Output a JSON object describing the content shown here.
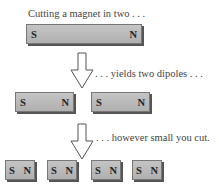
{
  "captions": {
    "step1": "Cutting a magnet in two . . .",
    "step2": ". . . yields two dipoles . . .",
    "step3": ". . . however small you cut."
  },
  "magnets": {
    "whole": {
      "s": "S",
      "n": "N"
    },
    "halves": [
      {
        "s": "S",
        "n": "N"
      },
      {
        "s": "S",
        "n": "N"
      }
    ],
    "quarters": [
      {
        "s": "S",
        "n": "N"
      },
      {
        "s": "S",
        "n": "N"
      },
      {
        "s": "S",
        "n": "N"
      },
      {
        "s": "S",
        "n": "N"
      }
    ]
  },
  "colors": {
    "magnet_fill": "#bcbcbc",
    "magnet_shadow": "#555555",
    "arrow_stroke": "#555555",
    "text": "#444444"
  }
}
